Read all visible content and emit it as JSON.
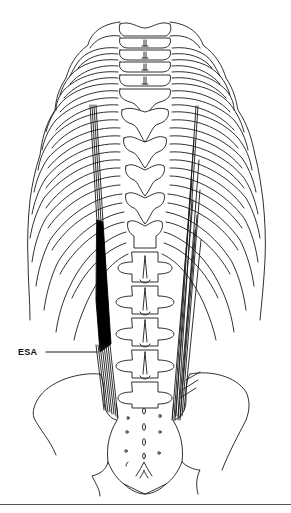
{
  "figure": {
    "labels": [
      {
        "id": "esa",
        "text": "ESA",
        "target": "erector spinae muscle (left, shaded)"
      }
    ],
    "colors": {
      "line": "#1a1a1a",
      "muscle_fill": "#000000",
      "background": "#ffffff",
      "rule": "#555555"
    }
  }
}
